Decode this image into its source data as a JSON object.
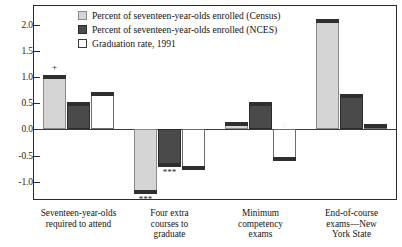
{
  "chart_data": {
    "type": "bar",
    "title": "",
    "subtitle": "",
    "xlabel": "",
    "ylabel": "",
    "ylim": [
      -1.35,
      2.38
    ],
    "grid": false,
    "legend_position": "top-center-inside",
    "yticks": [
      {
        "value": 2.0,
        "label": "2.0"
      },
      {
        "value": 1.5,
        "label": "1.5"
      },
      {
        "value": 1.0,
        "label": "1.0"
      },
      {
        "value": 0.5,
        "label": "0.5"
      },
      {
        "value": 0.0,
        "label": "0.0"
      },
      {
        "value": -0.5,
        "label": "-0.5"
      },
      {
        "value": -1.0,
        "label": "-1.0"
      }
    ],
    "categories": [
      "Seventeen-year-olds required to attend",
      "Four extra courses to graduate",
      "Minimum competency exams",
      "End-of-course exams—New York State"
    ],
    "category_label_lines": [
      [
        "Seventeen-year-olds",
        "required to attend"
      ],
      [
        "Four extra",
        "courses to",
        "graduate"
      ],
      [
        "Minimum",
        "competency",
        "exams"
      ],
      [
        "End-of-course",
        "exams—New",
        "York State"
      ]
    ],
    "series": [
      {
        "name": "Percent of seventeen-year-olds enrolled (Census)",
        "color": "#d5d5d5",
        "values": [
          1.03,
          -1.21,
          0.13,
          2.1
        ],
        "annotations": [
          "+",
          "***",
          "",
          ""
        ]
      },
      {
        "name": "Percent of seventeen-year-olds enrolled (NCES)",
        "color": "#4a4a4a",
        "values": [
          0.5,
          -0.7,
          0.5,
          0.66
        ],
        "annotations": [
          "",
          "***",
          "",
          ""
        ]
      },
      {
        "name": "Graduation rate, 1991",
        "color": "#ffffff",
        "values": [
          0.7,
          -0.76,
          -0.58,
          0.08
        ],
        "annotations": [
          "",
          "",
          "o",
          ""
        ]
      }
    ]
  },
  "legend": {
    "items": [
      {
        "label": "Percent of seventeen-year-olds enrolled (Census)",
        "swatch": "light"
      },
      {
        "label": "Percent of seventeen-year-olds enrolled (NCES)",
        "swatch": "dark"
      },
      {
        "label": "Graduation rate, 1991",
        "swatch": "white"
      }
    ]
  }
}
